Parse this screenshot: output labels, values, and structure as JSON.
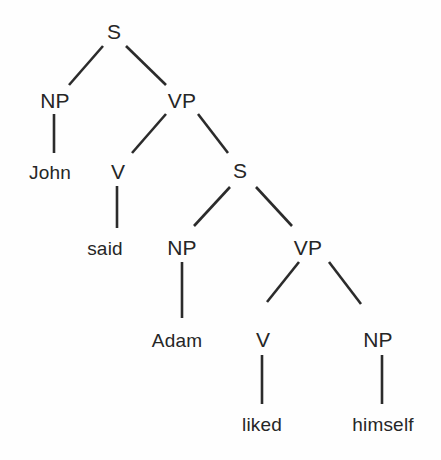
{
  "figure": {
    "kind": "syntax-tree-diagram",
    "sentence": "John said Adam liked himself",
    "background_color": "#fefefe",
    "ink_color": "#262626",
    "edge_color": "#2b2b2b",
    "edge_width": "2.6"
  },
  "nodes": {
    "s_root": {
      "label": "S",
      "x": 114,
      "y": 31,
      "type": "category"
    },
    "np_subject": {
      "label": "NP",
      "x": 55,
      "y": 100,
      "type": "category"
    },
    "vp_matrix": {
      "label": "VP",
      "x": 182,
      "y": 100,
      "type": "category"
    },
    "john": {
      "label": "John",
      "x": 50,
      "y": 172,
      "type": "terminal"
    },
    "v_matrix": {
      "label": "V",
      "x": 118,
      "y": 171,
      "type": "category"
    },
    "s_embedded": {
      "label": "S",
      "x": 240,
      "y": 170,
      "type": "category"
    },
    "said": {
      "label": "said",
      "x": 105,
      "y": 248,
      "type": "terminal"
    },
    "np_embedded_subject": {
      "label": "NP",
      "x": 182,
      "y": 247,
      "type": "category"
    },
    "vp_embedded": {
      "label": "VP",
      "x": 308,
      "y": 247,
      "type": "category"
    },
    "adam": {
      "label": "Adam",
      "x": 177,
      "y": 340,
      "type": "terminal"
    },
    "v_embedded": {
      "label": "V",
      "x": 263,
      "y": 339,
      "type": "category"
    },
    "np_object": {
      "label": "NP",
      "x": 378,
      "y": 339,
      "type": "category"
    },
    "liked": {
      "label": "liked",
      "x": 262,
      "y": 424,
      "type": "terminal"
    },
    "himself": {
      "label": "himself",
      "x": 383,
      "y": 424,
      "type": "terminal"
    }
  },
  "edges": [
    {
      "name": "edge-s-to-np-subject",
      "from": "s_root",
      "to": "np_subject",
      "x1": 103,
      "y1": 46,
      "x2": 69,
      "y2": 85
    },
    {
      "name": "edge-s-to-vp-matrix",
      "from": "s_root",
      "to": "vp_matrix",
      "x1": 126,
      "y1": 46,
      "x2": 166,
      "y2": 85
    },
    {
      "name": "edge-np-subject-to-john",
      "from": "np_subject",
      "to": "john",
      "x1": 54,
      "y1": 114,
      "x2": 54,
      "y2": 153
    },
    {
      "name": "edge-vp-to-v-matrix",
      "from": "vp_matrix",
      "to": "v_matrix",
      "x1": 166,
      "y1": 114,
      "x2": 132,
      "y2": 153
    },
    {
      "name": "edge-vp-to-s-embedded",
      "from": "vp_matrix",
      "to": "s_embedded",
      "x1": 198,
      "y1": 114,
      "x2": 228,
      "y2": 153
    },
    {
      "name": "edge-v-matrix-to-said",
      "from": "v_matrix",
      "to": "said",
      "x1": 117,
      "y1": 186,
      "x2": 117,
      "y2": 228
    },
    {
      "name": "edge-s-embedded-to-np",
      "from": "s_embedded",
      "to": "np_embedded_subject",
      "x1": 230,
      "y1": 187,
      "x2": 194,
      "y2": 226
    },
    {
      "name": "edge-s-embedded-to-vp",
      "from": "s_embedded",
      "to": "vp_embedded",
      "x1": 256,
      "y1": 187,
      "x2": 292,
      "y2": 226
    },
    {
      "name": "edge-np-embedded-to-adam",
      "from": "np_embedded_subject",
      "to": "adam",
      "x1": 182,
      "y1": 262,
      "x2": 182,
      "y2": 318
    },
    {
      "name": "edge-vp-embedded-to-v",
      "from": "vp_embedded",
      "to": "v_embedded",
      "x1": 299,
      "y1": 262,
      "x2": 267,
      "y2": 302
    },
    {
      "name": "edge-vp-embedded-to-np",
      "from": "vp_embedded",
      "to": "np_object",
      "x1": 329,
      "y1": 262,
      "x2": 361,
      "y2": 304
    },
    {
      "name": "edge-v-embedded-to-liked",
      "from": "v_embedded",
      "to": "liked",
      "x1": 262,
      "y1": 355,
      "x2": 262,
      "y2": 404
    },
    {
      "name": "edge-np-object-to-himself",
      "from": "np_object",
      "to": "himself",
      "x1": 382,
      "y1": 355,
      "x2": 382,
      "y2": 404
    }
  ]
}
